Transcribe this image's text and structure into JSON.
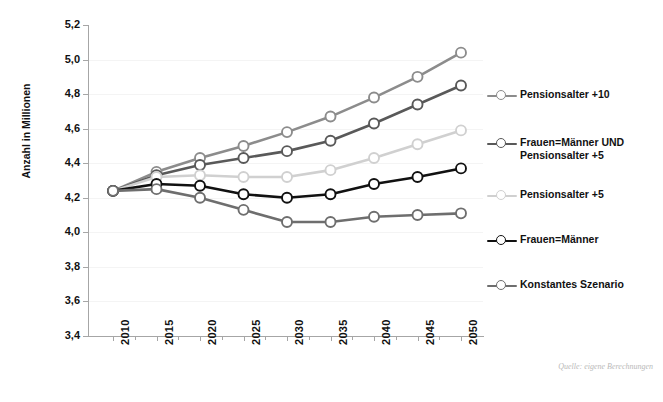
{
  "top_fragment": "",
  "axis": {
    "y_title": "Anzahl in Millionen",
    "y_ticks": [
      "5,2",
      "5,0",
      "4,8",
      "4,6",
      "4,4",
      "4,2",
      "4,0",
      "3,8",
      "3,6",
      "3,4"
    ],
    "x_ticks": [
      "2010",
      "2015",
      "2020",
      "2025",
      "2030",
      "2035",
      "2040",
      "2045",
      "2050"
    ]
  },
  "source_note": "Quelle: eigene Berechnungen",
  "legend": {
    "items": [
      {
        "label": "Pensionsalter +10",
        "color": "#8c8c8c",
        "top": 0
      },
      {
        "label": "Frauen=Männer UND\nPensionsalter +5",
        "color": "#595959",
        "top": 48
      },
      {
        "label": "Pensionsalter +5",
        "color": "#d0d0d0",
        "top": 100
      },
      {
        "label": "Frauen=Männer",
        "color": "#111111",
        "top": 145
      },
      {
        "label": "Konstantes Szenario",
        "color": "#6e6e6e",
        "top": 190
      }
    ]
  },
  "chart_data": {
    "type": "line",
    "title": "",
    "xlabel": "",
    "ylabel": "Anzahl in Millionen",
    "x": [
      2010,
      2015,
      2020,
      2025,
      2030,
      2035,
      2040,
      2045,
      2050
    ],
    "ylim": [
      3.4,
      5.2
    ],
    "ytick_step": 0.2,
    "grid": true,
    "legend_position": "right",
    "series": [
      {
        "name": "Pensionsalter +10",
        "color": "#8c8c8c",
        "values": [
          4.24,
          4.35,
          4.43,
          4.5,
          4.58,
          4.67,
          4.78,
          4.9,
          5.04
        ]
      },
      {
        "name": "Frauen=Männer UND Pensionsalter +5",
        "color": "#595959",
        "values": [
          4.24,
          4.33,
          4.39,
          4.43,
          4.47,
          4.53,
          4.63,
          4.74,
          4.85
        ]
      },
      {
        "name": "Pensionsalter +5",
        "color": "#d0d0d0",
        "values": [
          4.24,
          4.32,
          4.33,
          4.32,
          4.32,
          4.36,
          4.43,
          4.51,
          4.59
        ]
      },
      {
        "name": "Frauen=Männer",
        "color": "#111111",
        "values": [
          4.24,
          4.28,
          4.27,
          4.22,
          4.2,
          4.22,
          4.28,
          4.32,
          4.37
        ]
      },
      {
        "name": "Konstantes Szenario",
        "color": "#6e6e6e",
        "values": [
          4.24,
          4.25,
          4.2,
          4.13,
          4.06,
          4.06,
          4.09,
          4.1,
          4.11
        ]
      }
    ]
  }
}
